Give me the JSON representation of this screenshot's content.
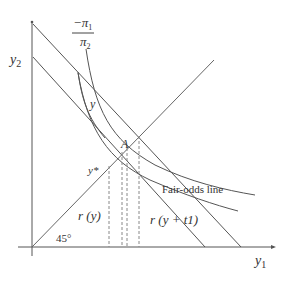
{
  "diagram": {
    "axes": {
      "y_label": "y",
      "y_label_sub": "2",
      "x_label": "y",
      "x_label_sub": "1"
    },
    "labels": {
      "slope_numerator": "−π",
      "slope_numerator_sub": "1",
      "slope_denominator": "π",
      "slope_denominator_sub": "2",
      "y_bar": "y",
      "y_star": "y*",
      "point_A": "A",
      "fair_odds": "Fair-odds line",
      "r_y": "r (y)",
      "r_y_t1": "r (y + t1)",
      "angle": "45°"
    },
    "colors": {
      "line": "#555555",
      "dash": "#888888",
      "text": "#333333"
    }
  }
}
